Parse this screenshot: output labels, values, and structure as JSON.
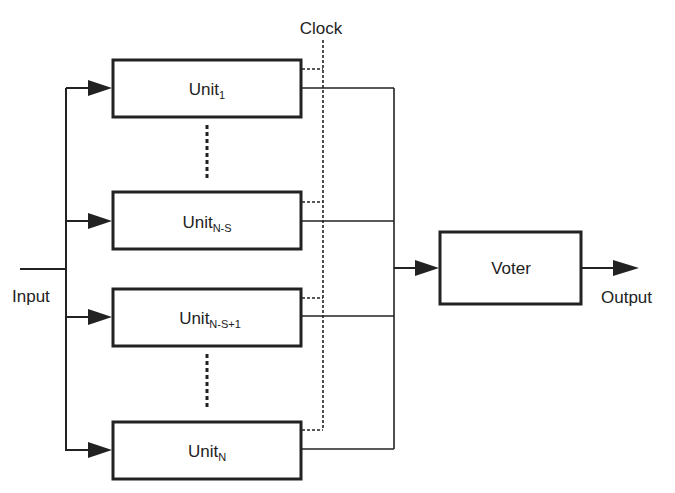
{
  "diagram": {
    "clock_label": "Clock",
    "input_label": "Input",
    "output_label": "Output",
    "voter_label": "Voter",
    "units": [
      {
        "base": "Unit",
        "sub": "1"
      },
      {
        "base": "Unit",
        "sub": "N-S"
      },
      {
        "base": "Unit",
        "sub": "N-S+1"
      },
      {
        "base": "Unit",
        "sub": "N"
      }
    ],
    "colors": {
      "stroke": "#222222",
      "background": "#ffffff"
    }
  }
}
